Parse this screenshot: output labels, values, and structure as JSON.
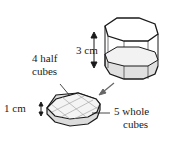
{
  "diagram": {
    "labels": {
      "height_big": "3 cm",
      "half_cubes_line1": "4 half",
      "half_cubes_line2": "cubes",
      "height_small": "1 cm",
      "whole_cubes_line1": "5 whole",
      "whole_cubes_line2": "cubes"
    },
    "colors": {
      "stroke": "#1a1a1a",
      "top_face": "#f2f2f2",
      "side_face": "#d9d9d9",
      "grid": "#9a9a9a",
      "arrow": "#666666"
    }
  }
}
